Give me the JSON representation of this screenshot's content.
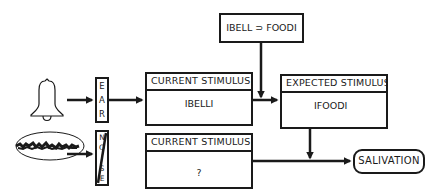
{
  "diagram": {
    "rule_box": {
      "text": "IBELL ⊃ FOODI"
    },
    "ear_box": {
      "letters": [
        "E",
        "A",
        "R"
      ]
    },
    "noise_box": {
      "letters": [
        "N",
        "O",
        "I",
        "S",
        "E"
      ],
      "struck_through": true
    },
    "current_stimulus_top": {
      "header": "CURRENT  STIMULUS",
      "value": "IBELLI"
    },
    "current_stimulus_bottom": {
      "header": "CURRENT  STIMULUS",
      "value": "?"
    },
    "expected_stimulus": {
      "header": "EXPECTED  STIMULUS",
      "value": "IFOODI"
    },
    "output": {
      "label": "SALIVATION"
    },
    "icons": {
      "bell": "bell-icon",
      "noise": "noise-scribble-icon"
    },
    "colors": {
      "ink": "#1a1a1a",
      "background": "#ffffff"
    }
  }
}
